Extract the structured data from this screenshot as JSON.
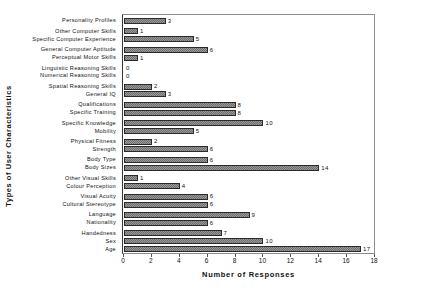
{
  "chart_data": {
    "type": "bar",
    "orientation": "horizontal",
    "title": "",
    "xlabel": "Number of Responses",
    "ylabel": "Types of User Characteristics",
    "xlim": [
      0,
      18
    ],
    "xticks": [
      0,
      2,
      4,
      6,
      8,
      10,
      12,
      14,
      16,
      18
    ],
    "grid": false,
    "legend": null,
    "categories": [
      "Personality Profiles",
      "Other Computer Skills",
      "Specific Computer Experience",
      "General Computer Aptitude",
      "Perceptual Motor Skills",
      "Linguistic Reasoning Skills",
      "Numerical Reasoning Skills",
      "Spatial Reasoning Skills",
      "General IQ",
      "Qualifications",
      "Specific Training",
      "Specific Knowledge",
      "Mobility",
      "Physical Fitness",
      "Strength",
      "Body Type",
      "Body Sizes",
      "Other Visual Skills",
      "Colour Perception",
      "Visual Acuity",
      "Cultural Stereotype",
      "Language",
      "Nationality",
      "Handedness",
      "Sex",
      "Age"
    ],
    "values": [
      3,
      1,
      5,
      6,
      1,
      0,
      0,
      2,
      3,
      8,
      8,
      10,
      5,
      2,
      6,
      6,
      14,
      1,
      4,
      6,
      6,
      9,
      6,
      7,
      10,
      17
    ],
    "value_labels": [
      "3",
      "1",
      "5",
      "6",
      "1",
      "0",
      "0",
      "2",
      "3",
      "8",
      "8",
      "10",
      "5",
      "2",
      "6",
      "6",
      "14",
      "1",
      "4",
      "6",
      "6",
      "9",
      "6",
      "7",
      "10",
      "17"
    ],
    "bar_color": "#9a9a9a",
    "bar_edge_color": "#2b2b2b",
    "background_color": "#ffffff",
    "axis_color": "#555555"
  }
}
